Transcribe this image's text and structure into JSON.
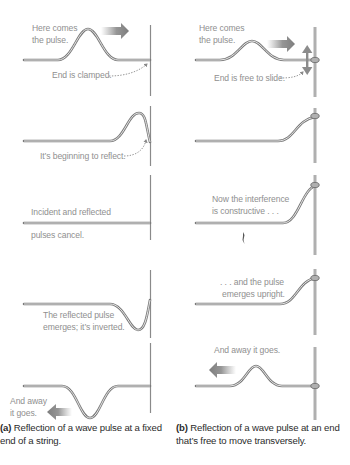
{
  "figure": {
    "columns": [
      {
        "id": "a",
        "end_type": "fixed",
        "panels": [
          {
            "labels": [
              "Here comes",
              "the pulse."
            ],
            "note": "End is clamped.",
            "arrow": "right"
          },
          {
            "labels": [
              "It’s beginning to reflect."
            ]
          },
          {
            "labels": [
              "Incident and reflected",
              "pulses cancel."
            ]
          },
          {
            "labels": [
              "The reflected pulse",
              "emerges; it’s inverted."
            ]
          },
          {
            "labels": [
              "And away",
              "it goes."
            ],
            "arrow": "left"
          }
        ],
        "caption": {
          "tag": "(a)",
          "text": "Reflection of a wave pulse at a fixed end of a string."
        }
      },
      {
        "id": "b",
        "end_type": "free",
        "panels": [
          {
            "labels": [
              "Here comes",
              "the pulse."
            ],
            "note": "End is free to slide.",
            "arrow": "right"
          },
          {
            "labels": []
          },
          {
            "labels": [
              "Now the interference",
              "is constructive . . ."
            ]
          },
          {
            "labels": [
              ". . . and the pulse",
              "emerges upright."
            ]
          },
          {
            "labels": [
              "And away it goes."
            ],
            "arrow": "left"
          }
        ],
        "caption": {
          "tag": "(b)",
          "text": "Reflection of a wave pulse at an end that’s free to move transversely."
        }
      }
    ]
  },
  "colors": {
    "string": "#7a7a7a",
    "string_core": "#f2f2f2",
    "wall": "#8a8a8a",
    "label": "#8f8f8f",
    "caption": "#2b2b2b"
  }
}
